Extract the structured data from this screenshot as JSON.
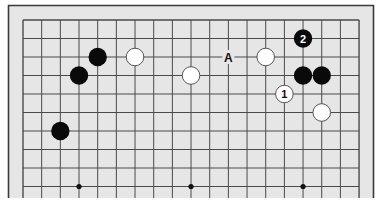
{
  "diagram": {
    "colors": {
      "background": "#e6e6e6",
      "frame": "#3a3a3a",
      "grid": "#4a4a4a",
      "black_stone": "#0a0a0a",
      "white_stone": "#ffffff",
      "white_stone_edge": "#444444"
    },
    "grid": {
      "columns": 19,
      "visible_rows": 10,
      "origin_x": 23,
      "origin_y": 20,
      "spacing_x": 18.67,
      "spacing_y": 18.5
    },
    "star_points": [
      {
        "col": 3,
        "row": 9
      },
      {
        "col": 9,
        "row": 9
      },
      {
        "col": 15,
        "row": 9
      }
    ],
    "stones": [
      {
        "color": "black",
        "col": 4,
        "row": 2,
        "label": ""
      },
      {
        "color": "black",
        "col": 3,
        "row": 3,
        "label": ""
      },
      {
        "color": "white",
        "col": 6,
        "row": 2,
        "label": ""
      },
      {
        "color": "white",
        "col": 9,
        "row": 3,
        "label": ""
      },
      {
        "color": "white",
        "col": 13,
        "row": 2,
        "label": ""
      },
      {
        "color": "black",
        "col": 15,
        "row": 1,
        "label": "2"
      },
      {
        "color": "black",
        "col": 15,
        "row": 3,
        "label": ""
      },
      {
        "color": "black",
        "col": 16,
        "row": 3,
        "label": ""
      },
      {
        "color": "white",
        "col": 14,
        "row": 4,
        "label": "1"
      },
      {
        "color": "white",
        "col": 16,
        "row": 5,
        "label": ""
      },
      {
        "color": "black",
        "col": 2,
        "row": 6,
        "label": ""
      }
    ],
    "marks": [
      {
        "text": "A",
        "col": 11,
        "row": 2
      }
    ]
  }
}
